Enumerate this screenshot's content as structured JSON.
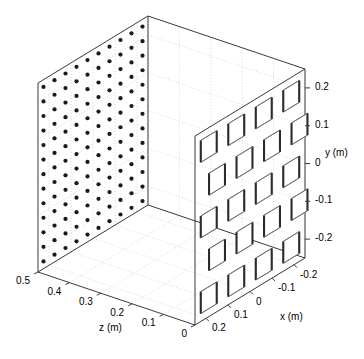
{
  "figure": {
    "type": "3d-box-plot",
    "background": "#ffffff",
    "line_color": "#3a3a3a",
    "grid_color": "#c8c8c8",
    "marker_color": "#1a1a1a",
    "hole_edge_dark": "#2b2b2b",
    "hole_edge_light": "#6e6e6e"
  },
  "chart_data": {
    "type": "scatter",
    "title": "",
    "xlabel": "x (m)",
    "ylabel": "y (m)",
    "zlabel": "z (m)",
    "grid": true,
    "legend": null,
    "xlim": [
      -0.25,
      0.25
    ],
    "ylim": [
      -0.25,
      0.25
    ],
    "zlim": [
      0.0,
      0.5
    ],
    "x_ticks": [
      "0.2",
      "0.1",
      "0",
      "-0.1",
      "-0.2"
    ],
    "x_tick_values": [
      0.2,
      0.1,
      0,
      -0.1,
      -0.2
    ],
    "y_ticks": [
      "0.2",
      "0.1",
      "0",
      "-0.1",
      "-0.2"
    ],
    "y_tick_values": [
      0.2,
      0.1,
      0,
      -0.1,
      -0.2
    ],
    "z_ticks": [
      "0.5",
      "0.4",
      "0.3",
      "0.2",
      "0.1",
      "0"
    ],
    "z_tick_values": [
      0.5,
      0.4,
      0.3,
      0.2,
      0.1,
      0.0
    ],
    "left_wall_markers": {
      "plane": "x = 0.25 (z-y plane)",
      "marker": "filled-circle",
      "n_cols_z": 10,
      "n_rows_y": 13,
      "count": 130,
      "note": "regular rectangular lattice of round dots on the z-y side wall"
    },
    "right_wall_patches": {
      "plane": "z = 0 (x-y front wall)",
      "shape": "square-aperture",
      "n_cols_x": 4,
      "n_rows_y": 5,
      "count": 20,
      "note": "grid of square holes with extruded dark edges (checker offset rows)"
    }
  },
  "axes": {
    "x": {
      "label": "x (m)",
      "ticks": [
        "0.2",
        "0.1",
        "0",
        "-0.1",
        "-0.2"
      ]
    },
    "y": {
      "label": "y (m)",
      "ticks": [
        "0.2",
        "0.1",
        "0",
        "-0.1",
        "-0.2"
      ]
    },
    "z": {
      "label": "z (m)",
      "ticks": [
        "0.5",
        "0.4",
        "0.3",
        "0.2",
        "0.1",
        "0"
      ]
    }
  },
  "labels": {
    "x_axis_name": "x (m)",
    "y_axis_name": "y (m)",
    "z_axis_name": "z (m)",
    "x0": "0.2",
    "x1": "0.1",
    "x2": "0",
    "x3": "-0.1",
    "x4": "-0.2",
    "y0": "0.2",
    "y1": "0.1",
    "y2": "0",
    "y3": "-0.1",
    "y4": "-0.2",
    "z0": "0.5",
    "z1": "0.4",
    "z2": "0.3",
    "z3": "0.2",
    "z4": "0.1",
    "z5": "0"
  }
}
